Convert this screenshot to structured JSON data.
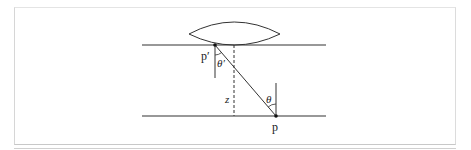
{
  "diagram": {
    "type": "optics-geometry",
    "labels": {
      "p_prime": "p′",
      "theta_prime": "θ′",
      "theta": "θ",
      "z": "z",
      "p": "p"
    },
    "colors": {
      "line": "#333333",
      "frame": "#d6d6d6",
      "background": "#ffffff"
    },
    "geometry": {
      "upper_plane_y": 45,
      "lower_plane_y": 116,
      "plane_x_start": 142,
      "plane_x_end": 326,
      "lens": {
        "left_x": 189,
        "right_x": 280,
        "top_y": 22,
        "tip_y": 34,
        "bottom_y": 45
      },
      "p_prime": {
        "x": 215,
        "y": 45
      },
      "p": {
        "x": 276,
        "y": 116
      },
      "dashed_x": 234
    }
  }
}
